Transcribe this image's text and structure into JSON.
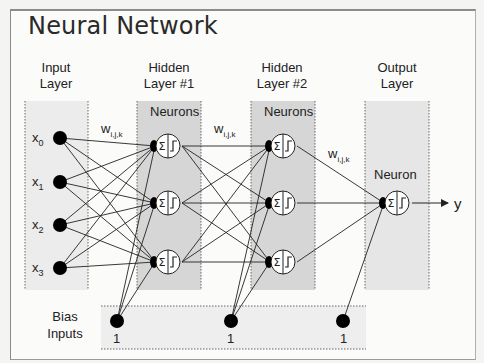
{
  "title": "Neural Network",
  "layers": [
    {
      "id": "input",
      "label_line1": "Input",
      "label_line2": "Layer"
    },
    {
      "id": "hidden1",
      "label_line1": "Hidden",
      "label_line2": "Layer #1",
      "box_label": "Neurons"
    },
    {
      "id": "hidden2",
      "label_line1": "Hidden",
      "label_line2": "Layer #2",
      "box_label": "Neurons"
    },
    {
      "id": "output",
      "label_line1": "Output",
      "label_line2": "Layer",
      "box_label": "Neuron"
    }
  ],
  "inputs": [
    {
      "base": "x",
      "sub": "0"
    },
    {
      "base": "x",
      "sub": "1"
    },
    {
      "base": "x",
      "sub": "2"
    },
    {
      "base": "x",
      "sub": "3"
    }
  ],
  "weights_label": {
    "base": "w",
    "sub": "i,j,k"
  },
  "neuron_symbols": {
    "sum": "Σ",
    "activation": "∫"
  },
  "output_label": "y",
  "bias": {
    "label_line1": "Bias",
    "label_line2": "Inputs",
    "values": [
      "1",
      "1",
      "1"
    ]
  },
  "colors": {
    "input_band": "#ececec",
    "hidden_band": "#d6d6d6",
    "output_band": "#e6e6e6",
    "bias_band": "#eeeeee",
    "node": "#000000",
    "line": "#222222"
  }
}
